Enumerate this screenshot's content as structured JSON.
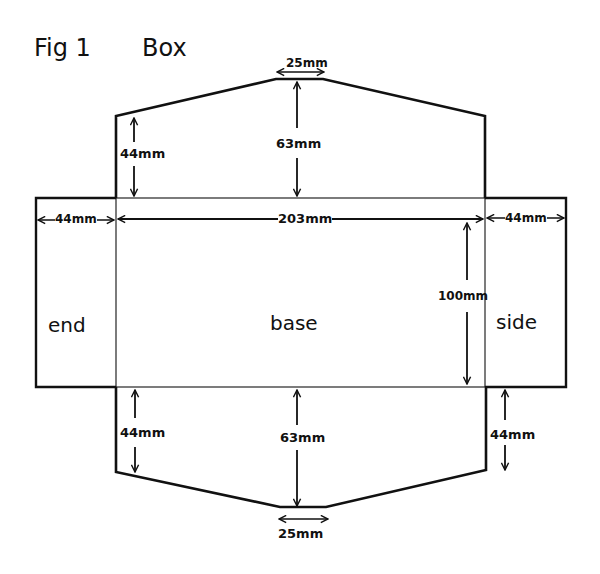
{
  "figure": {
    "label": "Fig 1",
    "title": "Box"
  },
  "panels": {
    "end": "end",
    "base": "base",
    "side": "side"
  },
  "dimensions": {
    "top_flap_tip_width": "25mm",
    "top_flap_height": "63mm",
    "top_flap_edge_height": "44mm",
    "end_width": "44mm",
    "base_length": "203mm",
    "side_width": "44mm",
    "base_width": "100mm",
    "bottom_flap_edge_height_left": "44mm",
    "bottom_flap_height": "63mm",
    "bottom_flap_edge_height_right": "44mm",
    "bottom_flap_tip_width": "25mm"
  },
  "colors": {
    "ink": "#111111",
    "paper": "#ffffff"
  }
}
